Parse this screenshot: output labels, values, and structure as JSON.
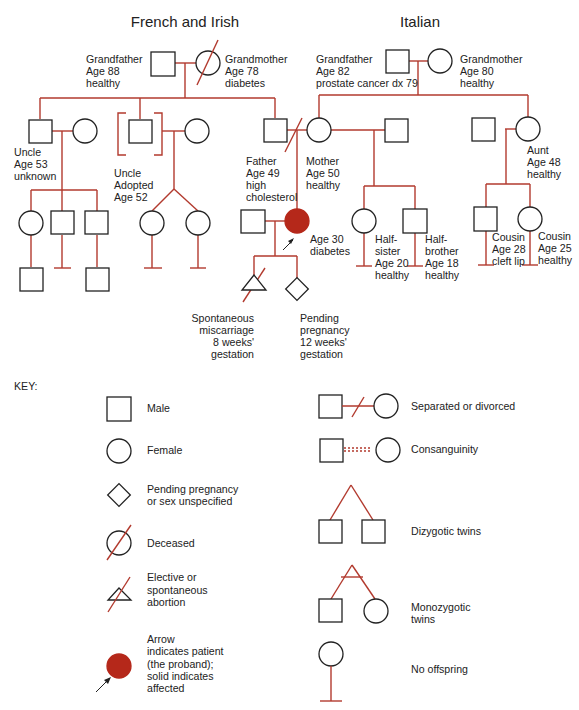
{
  "headers": {
    "left": "French and Irish",
    "right": "Italian"
  },
  "people": {
    "fi_grandfather": [
      "Grandfather",
      "Age 88",
      "healthy"
    ],
    "fi_grandmother": [
      "Grandmother",
      "Age 78",
      "diabetes"
    ],
    "it_grandfather": [
      "Grandfather",
      "Age 82",
      "prostate cancer dx 79"
    ],
    "it_grandmother": [
      "Grandmother",
      "Age 80",
      "healthy"
    ],
    "uncle1": [
      "Uncle",
      "Age 53",
      "unknown"
    ],
    "uncle2": [
      "Uncle",
      "Adopted",
      "Age 52"
    ],
    "father": [
      "Father",
      "Age 49",
      "high",
      "cholesterol"
    ],
    "mother": [
      "Mother",
      "Age 50",
      "healthy"
    ],
    "aunt": [
      "Aunt",
      "Age 48",
      "healthy"
    ],
    "proband": [
      "Age 30",
      "diabetes"
    ],
    "halfsister": [
      "Half-",
      "sister",
      "Age 20",
      "healthy"
    ],
    "halfbrother": [
      "Half-",
      "brother",
      "Age 18",
      "healthy"
    ],
    "cousin1": [
      "Cousin",
      "Age 28",
      "cleft lip"
    ],
    "cousin2": [
      "Cousin",
      "Age 25",
      "healthy"
    ],
    "miscarriage": [
      "Spontaneous",
      "miscarriage",
      "8 weeks'",
      "gestation"
    ],
    "pending": [
      "Pending",
      "pregnancy",
      "12 weeks'",
      "gestation"
    ]
  },
  "key": {
    "title": "KEY:",
    "male": [
      "Male"
    ],
    "female": [
      "Female"
    ],
    "pending": [
      "Pending pregnancy",
      "or sex unspecified"
    ],
    "deceased": [
      "Deceased"
    ],
    "abortion": [
      "Elective or",
      "spontaneous",
      "abortion"
    ],
    "proband": [
      "Arrow",
      "indicates patient",
      "(the proband);",
      "solid indicates",
      "affected"
    ],
    "separated": [
      "Separated or divorced"
    ],
    "consanguinity": [
      "Consanguinity"
    ],
    "dizygotic": [
      "Dizygotic twins"
    ],
    "monozygotic": [
      "Monozygotic",
      "twins"
    ],
    "no_offspring": [
      "No offspring"
    ]
  },
  "colors": {
    "line": "#b23a2e",
    "affected": "#b5281a",
    "symbol": "#222222"
  }
}
